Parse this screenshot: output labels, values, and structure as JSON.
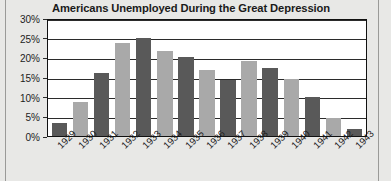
{
  "chart_data": {
    "type": "bar",
    "title": "Americans Unemployed During the Great Depression",
    "xlabel": "",
    "ylabel": "",
    "ylim": [
      0,
      30
    ],
    "y_ticks": [
      "0%",
      "5%",
      "10%",
      "15%",
      "20%",
      "25%",
      "30%"
    ],
    "y_tick_values": [
      0,
      5,
      10,
      15,
      20,
      25,
      30
    ],
    "grid": true,
    "legend": "none",
    "categories": [
      "1929",
      "1930",
      "1931",
      "1932",
      "1933",
      "1934",
      "1935",
      "1936",
      "1937",
      "1938",
      "1939",
      "1940",
      "1941",
      "1942",
      "1943"
    ],
    "values": [
      3.2,
      8.7,
      15.9,
      23.6,
      24.9,
      21.7,
      20.1,
      16.9,
      14.3,
      19.0,
      17.2,
      14.6,
      9.9,
      4.7,
      1.9
    ],
    "bar_colors": [
      "dark",
      "light",
      "dark",
      "light",
      "dark",
      "light",
      "dark",
      "light",
      "dark",
      "light",
      "dark",
      "light",
      "dark",
      "light",
      "dark"
    ],
    "colors": {
      "dark_bar": "#595959",
      "light_bar": "#a9a9a9",
      "plot_background": "#ffffff",
      "page_background": "#e8e8e6",
      "axis": "#111111",
      "text": "#1c1c1c"
    }
  }
}
